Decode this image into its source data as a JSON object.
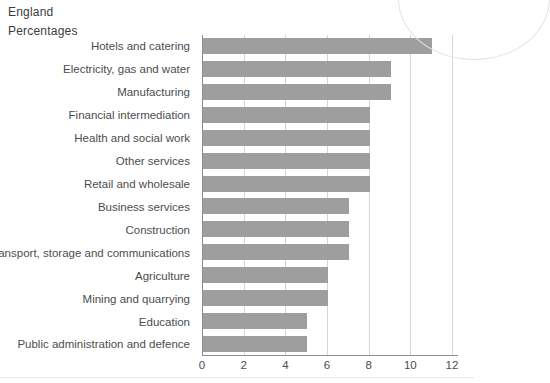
{
  "header": {
    "region": "England",
    "units": "Percentages"
  },
  "chart_data": {
    "type": "bar",
    "orientation": "horizontal",
    "title": "England",
    "subtitle": "Percentages",
    "categories": [
      "Hotels and catering",
      "Electricity, gas and water",
      "Manufacturing",
      "Financial intermediation",
      "Health and social work",
      "Other services",
      "Retail and wholesale",
      "Business services",
      "Construction",
      "Transport, storage and communications",
      "Agriculture",
      "Mining and quarrying",
      "Education",
      "Public administration and defence"
    ],
    "values": [
      11,
      9,
      9,
      8,
      8,
      8,
      8,
      7,
      7,
      7,
      6,
      6,
      5,
      5
    ],
    "xlabel": "",
    "ylabel": "",
    "xlim": [
      0,
      12
    ],
    "xticks": [
      0,
      2,
      4,
      6,
      8,
      10,
      12
    ],
    "xtick_labels": [
      "0",
      "2",
      "4",
      "6",
      "8",
      "10",
      "12"
    ],
    "grid": true,
    "legend": "none",
    "bar_color": "#9e9e9e",
    "axis_color": "#8c8c8c",
    "grid_color": "#d6d6d6",
    "text_color": "#4d4d4d"
  }
}
